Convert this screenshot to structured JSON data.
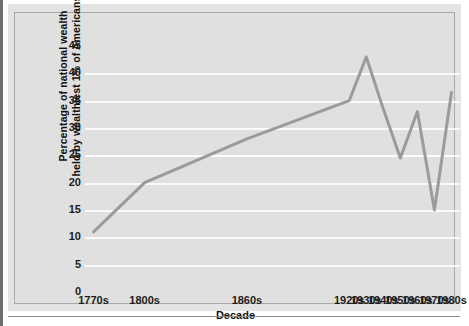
{
  "chart_data": {
    "type": "line",
    "title": "",
    "subtitle": "",
    "xlabel": "Decade",
    "ylabel": "Percentage of national wealth held by wealthiest 1% of Americans",
    "ylabel_line1": "Percentage of national wealth",
    "ylabel_line2": "held by wealthiest 1% of Americans",
    "categories": [
      "1770s",
      "1800s",
      "1860s",
      "1920s",
      "1930s",
      "1940s",
      "1950s",
      "1960s",
      "1970s",
      "1980s"
    ],
    "x_values": [
      1770,
      1800,
      1860,
      1920,
      1930,
      1940,
      1950,
      1960,
      1970,
      1980
    ],
    "values": [
      11,
      20,
      28,
      35,
      43,
      33.5,
      24.5,
      33,
      15,
      36.5
    ],
    "series": [
      {
        "name": "Percentage of national wealth held by wealthiest 1%",
        "values": [
          11,
          20,
          28,
          35,
          43,
          33.5,
          24.5,
          33,
          15,
          36.5
        ],
        "color": "#9b9b9b"
      }
    ],
    "ylim": [
      0,
      45
    ],
    "xlim": [
      1765,
      1985
    ],
    "y_ticks": [
      0,
      5,
      10,
      15,
      20,
      25,
      30,
      35,
      40,
      45
    ],
    "y_tick_labels": [
      "0",
      "5",
      "10",
      "15",
      "20",
      "25",
      "30",
      "35",
      "40",
      "45"
    ],
    "x_tick_labels": [
      "1770s",
      "1800s",
      "1860s",
      "1920s",
      "1930s",
      "1940s",
      "1950s",
      "1960s",
      "1970s",
      "1980s"
    ],
    "grid": true,
    "grid_color": "#fbfbfb",
    "grid_axis": "y",
    "legend": false,
    "legend_position": "none",
    "plot_background": "#e0e0e0",
    "figure_background": "#e3e3e3",
    "line_color": "#9b9b9b",
    "line_width": 3,
    "markers": false,
    "annotations": []
  },
  "figure": {
    "frame_border_color": "#a9a9a9",
    "rule_color": "#8a8a8a"
  }
}
